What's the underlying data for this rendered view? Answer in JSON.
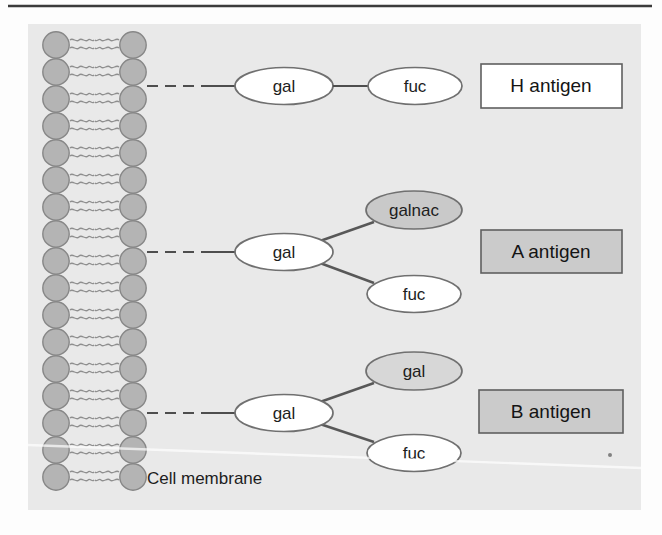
{
  "figure": {
    "membrane_label": "Cell membrane",
    "membrane_rows": 17
  },
  "antigens": [
    {
      "name": "H antigen",
      "type": "linear",
      "root": {
        "text": "gal",
        "fill": "#ffffff"
      },
      "branches": [
        {
          "text": "fuc",
          "fill": "#ffffff"
        }
      ],
      "box": {
        "label": "H antigen",
        "fill": "#ffffff"
      }
    },
    {
      "name": "A antigen",
      "type": "branched",
      "root": {
        "text": "gal",
        "fill": "#ffffff"
      },
      "branches": [
        {
          "text": "galnac",
          "fill": "#c9c9c9"
        },
        {
          "text": "fuc",
          "fill": "#ffffff"
        }
      ],
      "box": {
        "label": "A antigen",
        "fill": "#cbcbcb"
      }
    },
    {
      "name": "B antigen",
      "type": "branched",
      "root": {
        "text": "gal",
        "fill": "#ffffff"
      },
      "branches": [
        {
          "text": "gal",
          "fill": "#d7d7d7"
        },
        {
          "text": "fuc",
          "fill": "#ffffff"
        }
      ],
      "box": {
        "label": "B antigen",
        "fill": "#cbcbcb"
      }
    }
  ],
  "colors": {
    "panel_background": "#e9e9e9",
    "lipid_fill": "#b4b4b4",
    "lipid_stroke": "#878787",
    "connector": "#4e4e4e",
    "node_stroke": "#707070",
    "box_border": "#5f5f5f",
    "text": "#1d1d1d"
  }
}
